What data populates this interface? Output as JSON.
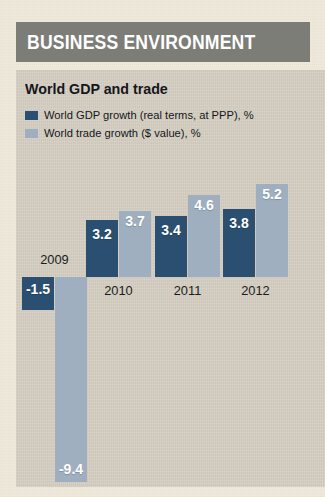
{
  "header": {
    "title": "BUSINESS ENVIRONMENT",
    "band_color": "#7d7d78"
  },
  "panel": {
    "background_color": "#d5cfc2"
  },
  "chart_data": {
    "type": "bar",
    "title": "World GDP and trade",
    "xlabel": "",
    "ylabel": "",
    "categories": [
      "2009",
      "2010",
      "2011",
      "2012"
    ],
    "series": [
      {
        "name": "World GDP growth (real terms, at PPP), %",
        "color": "#2b4f70",
        "values": [
          -1.5,
          3.2,
          3.4,
          3.8
        ],
        "labels": [
          "-1.5",
          "3.2",
          "3.4",
          "3.8"
        ]
      },
      {
        "name": "World trade growth ($ value), %",
        "color": "#9fafc0",
        "values": [
          -9.4,
          3.7,
          4.6,
          5.2
        ],
        "labels": [
          "-9.4",
          "3.7",
          "4.6",
          "5.2"
        ]
      }
    ],
    "ylim": [
      -9.4,
      5.2
    ],
    "grid": false,
    "legend_position": "top-left",
    "zero_baseline": true
  }
}
